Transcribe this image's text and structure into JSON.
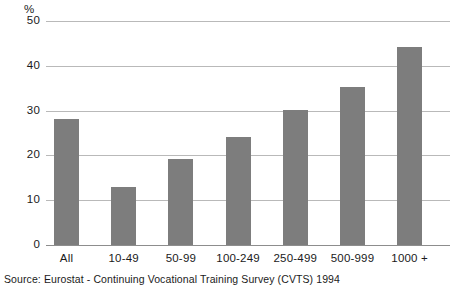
{
  "chart_data": {
    "type": "bar",
    "title": "",
    "subtitle": "",
    "xlabel": "",
    "ylabel": "%",
    "unit_label": "%",
    "categories": [
      "All",
      "10-49",
      "50-99",
      "100-249",
      "250-499",
      "500-999",
      "1000 +"
    ],
    "values": [
      28.1,
      13.0,
      19.2,
      24.2,
      30.2,
      35.3,
      44.2
    ],
    "series": [
      {
        "name": "Percentage",
        "values": [
          28.1,
          13.0,
          19.2,
          24.2,
          30.2,
          35.3,
          44.2
        ]
      }
    ],
    "ylim": [
      0,
      50
    ],
    "yticks": [
      0,
      10,
      20,
      30,
      40,
      50
    ],
    "ytick_labels": [
      "0",
      "10",
      "20",
      "30",
      "40",
      "50"
    ],
    "grid": true,
    "grid_axis": "y",
    "legend": false,
    "legend_position": "none",
    "bar_color": "#7d7d7d",
    "gridline_color": "#b9b9b9",
    "axis_color": "#8d8d8d",
    "background_color": "#ffffff",
    "annotations": []
  },
  "source": {
    "text": "Source:  Eurostat - Continuing Vocational Training Survey (CVTS) 1994"
  }
}
